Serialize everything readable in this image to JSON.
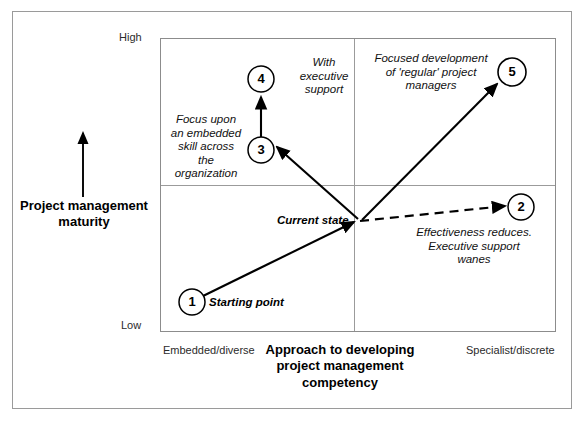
{
  "figure": {
    "title_implicit": "Project management maturity vs Approach to developing project management competency",
    "y_axis": {
      "label": "Project management\nmaturity",
      "label_line1": "Project management",
      "label_line2": "maturity",
      "high_tick": "High",
      "low_tick": "Low",
      "arrow_direction": "up"
    },
    "x_axis": {
      "title_line1": "Approach to developing",
      "title_line2": "project management",
      "title_line3": "competency",
      "left_end_label": "Embedded/diverse",
      "right_end_label": "Specialist/discrete"
    },
    "quadrants": {
      "vertical_divider": true,
      "horizontal_divider": true
    }
  },
  "nodes": [
    {
      "id": "1",
      "label": "1",
      "caption": "Starting point",
      "cx": 192,
      "cy": 302,
      "r": 13
    },
    {
      "id": "2",
      "label": "2",
      "caption": "Effectiveness reduces. Executive support wanes",
      "cx": 521,
      "cy": 207,
      "r": 13
    },
    {
      "id": "3",
      "label": "3",
      "caption": "Focus upon an embedded skill across the organization",
      "cx": 261,
      "cy": 150,
      "r": 13
    },
    {
      "id": "4",
      "label": "4",
      "caption": "With executive support",
      "cx": 261,
      "cy": 79,
      "r": 13
    },
    {
      "id": "5",
      "label": "5",
      "caption": "Focused development of 'regular' project managers",
      "cx": 512,
      "cy": 72,
      "r": 13
    }
  ],
  "annotations": {
    "current_state": "Current state",
    "starting_point": "Starting point",
    "with_executive_support": {
      "line1": "With",
      "line2": "executive",
      "line3": "support"
    },
    "focus_embedded": {
      "line1": "Focus upon",
      "line2": "an embedded",
      "line3": "skill across",
      "line4": "the",
      "line5": "organization"
    },
    "focused_development": {
      "line1": "Focused development",
      "line2": "of 'regular' project",
      "line3": "managers"
    },
    "effectiveness_reduces": {
      "line1": "Effectiveness reduces.",
      "line2": "Executive support",
      "line3": "wanes"
    }
  },
  "arrows": [
    {
      "name": "start-to-current",
      "from": "1",
      "to": "current-state",
      "style": "solid"
    },
    {
      "name": "current-to-2",
      "from": "current-state",
      "to": "2",
      "style": "dashed"
    },
    {
      "name": "current-to-3",
      "from": "current-state",
      "to": "3",
      "style": "solid"
    },
    {
      "name": "3-to-4",
      "from": "3",
      "to": "4",
      "style": "solid"
    },
    {
      "name": "current-to-5",
      "from": "current-state",
      "to": "5",
      "style": "solid"
    },
    {
      "name": "y-axis-arrow",
      "from": "bottom",
      "to": "top",
      "style": "solid"
    }
  ],
  "colors": {
    "line": "#000000",
    "frame": "#8c8c8c",
    "background": "#ffffff",
    "text": "#000000"
  }
}
